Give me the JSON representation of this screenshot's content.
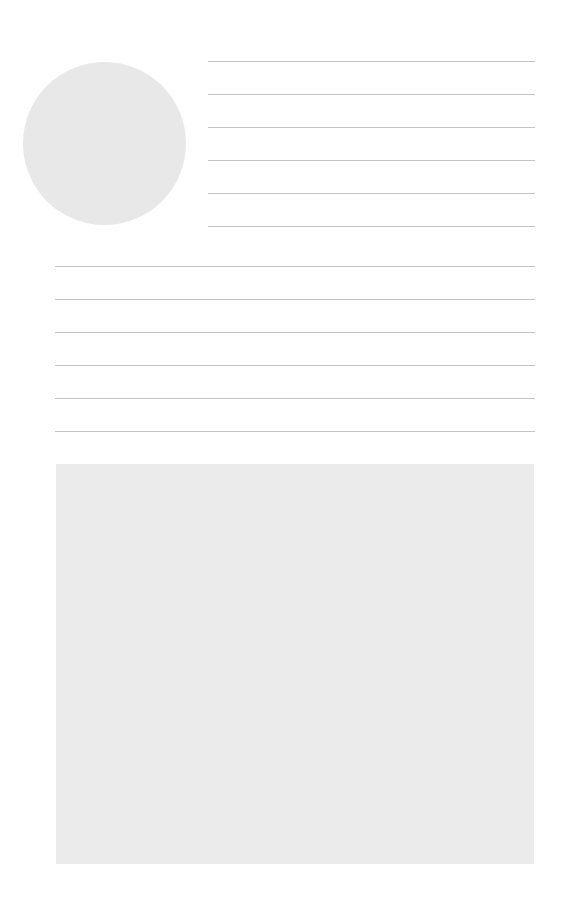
{
  "page": {
    "background": "#ffffff",
    "photo_circle": {
      "x": 23,
      "y": 62,
      "diameter": 163,
      "fill": "#e8e8e8"
    },
    "short_rules": {
      "x": 208,
      "width": 327,
      "color": "#c4c4c4",
      "y": [
        61,
        94,
        127,
        160,
        193,
        226
      ]
    },
    "long_rules": {
      "x": 55,
      "width": 480,
      "color": "#c4c4c4",
      "y": [
        266,
        299,
        332,
        365,
        398,
        431
      ]
    },
    "image_box": {
      "x": 56,
      "y": 464,
      "width": 478,
      "height": 400,
      "fill": "#ebebeb"
    }
  }
}
